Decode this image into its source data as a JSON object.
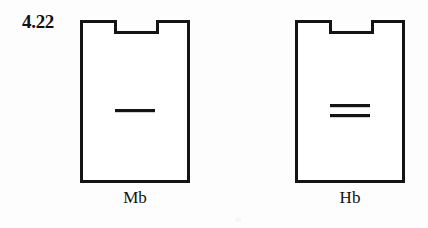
{
  "figure": {
    "number": "4.22",
    "background_color": "#fdfdfd",
    "stroke_color": "#141414",
    "stroke_width": 3
  },
  "diagram_data": {
    "type": "diagram",
    "description": "Two identical notched rectangular (vial/flask outline) shapes side by side, each containing a horizontal line marking inside; labeled beneath.",
    "shapes": [
      {
        "id": "mb",
        "caption": "Mb",
        "marking_icon": "single-dash-icon",
        "marking_symbol": "—",
        "marking_line_count": 1,
        "geometry": {
          "x": 80,
          "y": 20,
          "width": 112,
          "height": 160,
          "notch_x": 115,
          "notch_width": 42,
          "notch_depth": 11
        }
      },
      {
        "id": "hb",
        "caption": "Hb",
        "marking_icon": "double-dash-icon",
        "marking_symbol": "=",
        "marking_line_count": 2,
        "geometry": {
          "x": 295,
          "y": 20,
          "width": 112,
          "height": 160,
          "notch_x": 330,
          "notch_width": 42,
          "notch_depth": 11
        }
      }
    ]
  }
}
